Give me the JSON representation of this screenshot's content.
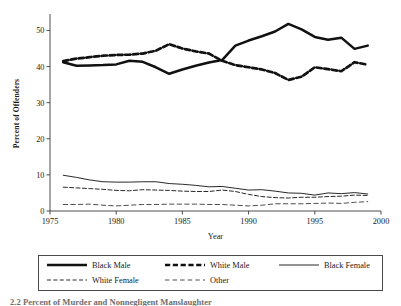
{
  "figure": {
    "caption": "2.2 Percent of Murder and Nonnegligent Manslaughter"
  },
  "chart_data": {
    "type": "line",
    "title": "",
    "subtitle": "",
    "xlabel": "Year",
    "ylabel": "Percent of Offenders",
    "xlim": [
      1975,
      2000
    ],
    "ylim": [
      0,
      54
    ],
    "xticks": [
      1975,
      1980,
      1985,
      1990,
      1995,
      2000
    ],
    "xtick_labels": [
      "1975",
      "1980",
      "1985",
      "1990",
      "1995",
      "2000"
    ],
    "yticks": [
      0,
      10,
      20,
      30,
      40,
      50
    ],
    "ytick_labels": [
      "0",
      "10",
      "20",
      "30",
      "40",
      "50"
    ],
    "grid": false,
    "legend_position": "below",
    "x": [
      1976,
      1977,
      1978,
      1979,
      1980,
      1981,
      1982,
      1983,
      1984,
      1985,
      1986,
      1987,
      1988,
      1989,
      1990,
      1991,
      1992,
      1993,
      1994,
      1995,
      1996,
      1997,
      1998,
      1999
    ],
    "series": [
      {
        "name": "Black Male",
        "style": "solid-thick",
        "values": [
          41.2,
          40.2,
          40.3,
          40.4,
          40.6,
          41.6,
          41.3,
          39.8,
          38.0,
          39.2,
          40.2,
          41.1,
          41.8,
          45.8,
          47.2,
          48.4,
          49.7,
          51.8,
          50.3,
          48.2,
          47.4,
          48.0,
          44.9,
          45.8
        ]
      },
      {
        "name": "White Male",
        "style": "dashed-thick",
        "values": [
          41.5,
          42.2,
          42.6,
          43.0,
          43.2,
          43.3,
          43.6,
          44.4,
          46.2,
          45.0,
          44.2,
          43.6,
          41.6,
          40.4,
          39.8,
          39.2,
          38.2,
          36.3,
          37.2,
          39.8,
          39.3,
          38.7,
          41.2,
          40.5
        ]
      },
      {
        "name": "Black Female",
        "style": "solid-thin",
        "values": [
          9.9,
          9.3,
          8.6,
          8.1,
          8.0,
          8.0,
          8.1,
          8.1,
          7.6,
          7.4,
          7.1,
          6.7,
          6.8,
          6.3,
          5.8,
          5.9,
          5.5,
          5.0,
          4.9,
          4.4,
          5.0,
          4.8,
          5.1,
          4.7
        ]
      },
      {
        "name": "White Female",
        "style": "dashed-thin",
        "values": [
          6.6,
          6.4,
          6.2,
          6.0,
          5.7,
          5.6,
          5.9,
          5.8,
          5.7,
          5.5,
          5.4,
          5.4,
          5.8,
          5.4,
          4.6,
          4.0,
          3.7,
          3.6,
          3.8,
          3.8,
          4.0,
          4.1,
          4.4,
          4.3
        ]
      },
      {
        "name": "Other",
        "style": "dashed-light",
        "values": [
          1.8,
          1.8,
          1.9,
          1.6,
          1.4,
          1.6,
          1.8,
          1.8,
          1.9,
          1.9,
          1.9,
          1.8,
          1.8,
          1.6,
          1.4,
          1.6,
          2.0,
          2.0,
          2.0,
          2.1,
          2.2,
          2.1,
          2.4,
          2.6
        ]
      }
    ]
  },
  "legend": {
    "entries": [
      {
        "label": "Black Male",
        "style": "solid-thick"
      },
      {
        "label": "White Male",
        "style": "dashed-thick"
      },
      {
        "label": "Black Female",
        "style": "solid-thin"
      },
      {
        "label": "White Female",
        "style": "dashed-thin"
      },
      {
        "label": "Other",
        "style": "dashed-light"
      }
    ]
  }
}
